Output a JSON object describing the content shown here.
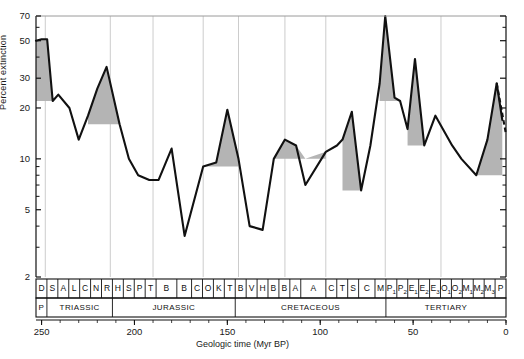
{
  "chart_data": {
    "type": "line",
    "title": "",
    "xlabel": "Geologic time (Myr BP)",
    "ylabel": "Percent extinction",
    "yscale": "log",
    "ylim": [
      2,
      70
    ],
    "xlim": [
      253,
      0
    ],
    "grid": "vertical gridlines at period/epoch boundaries",
    "legend": "none",
    "y_ticks": [
      70,
      50,
      30,
      20,
      10,
      5,
      2
    ],
    "x_ticks": [
      250,
      200,
      150,
      100,
      50,
      0
    ],
    "annotations": [
      "Shaded area under peaks marks extinction above background",
      "Final segment at right is dashed (uncertain / incomplete data)"
    ],
    "x": [
      253,
      250,
      247,
      244,
      241,
      235,
      230,
      225,
      220,
      215,
      208,
      203,
      198,
      192,
      187,
      180,
      173,
      163,
      156,
      150,
      144,
      138,
      131,
      125,
      119,
      113,
      108,
      97,
      91,
      88,
      83,
      78,
      73,
      68,
      65,
      60,
      57,
      53,
      49,
      44,
      38,
      34,
      29,
      24,
      16,
      10,
      5,
      2,
      0
    ],
    "values": [
      50,
      51,
      51,
      22,
      24,
      20,
      13,
      18,
      26,
      35,
      16,
      10,
      8,
      7.5,
      7.5,
      11.5,
      3.5,
      9,
      9.5,
      19.5,
      10,
      4,
      3.8,
      10,
      13,
      12,
      7,
      11,
      12,
      13,
      19,
      6.5,
      12,
      28,
      70,
      23,
      22,
      15,
      39,
      12,
      18,
      15,
      12,
      10,
      8,
      13,
      28,
      17,
      14
    ],
    "stages": [
      {
        "label": "D"
      },
      {
        "label": "S"
      },
      {
        "label": "A"
      },
      {
        "label": "L"
      },
      {
        "label": "C"
      },
      {
        "label": "N"
      },
      {
        "label": "R"
      },
      {
        "label": "H"
      },
      {
        "label": "S"
      },
      {
        "label": "P"
      },
      {
        "label": "T"
      },
      {
        "label": "B"
      },
      {
        "label": "B"
      },
      {
        "label": "C"
      },
      {
        "label": "O"
      },
      {
        "label": "K"
      },
      {
        "label": "T"
      },
      {
        "label": "B"
      },
      {
        "label": "V"
      },
      {
        "label": "H"
      },
      {
        "label": "B"
      },
      {
        "label": "B"
      },
      {
        "label": "A"
      },
      {
        "label": "A"
      },
      {
        "label": "C"
      },
      {
        "label": "T"
      },
      {
        "label": "S"
      },
      {
        "label": "C"
      },
      {
        "label": "M"
      },
      {
        "label": "P",
        "sub": "1"
      },
      {
        "label": "P",
        "sub": "2"
      },
      {
        "label": "E",
        "sub": "1"
      },
      {
        "label": "E",
        "sub": "2"
      },
      {
        "label": "E",
        "sub": "3"
      },
      {
        "label": "O",
        "sub": "1"
      },
      {
        "label": "O",
        "sub": "2"
      },
      {
        "label": "M",
        "sub": "1"
      },
      {
        "label": "M",
        "sub": "2"
      },
      {
        "label": "M",
        "sub": "3"
      },
      {
        "label": "P"
      }
    ],
    "periods": [
      {
        "label": "P"
      },
      {
        "label": "TRIASSIC"
      },
      {
        "label": "JURASSIC"
      },
      {
        "label": "CRETACEOUS"
      },
      {
        "label": "TERTIARY"
      }
    ],
    "colors": {
      "line": "#111111",
      "fill": "#b4b4b4",
      "axis": "#111111",
      "gridline": "#cccccc",
      "background": "#ffffff"
    }
  }
}
